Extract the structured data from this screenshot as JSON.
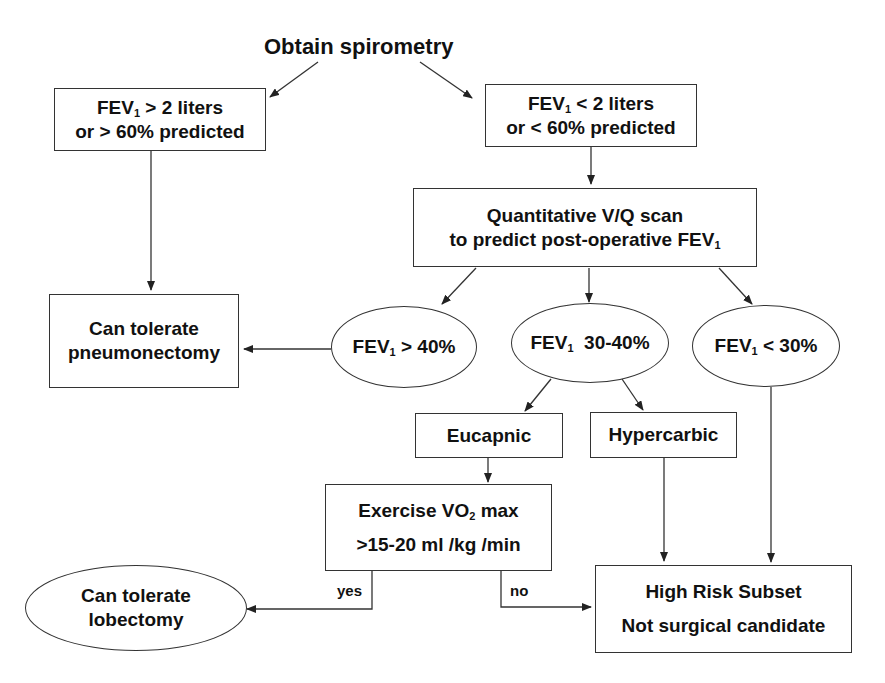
{
  "title": "Obtain spirometry",
  "nodes": {
    "fev_high": {
      "line1_pre": "FEV",
      "line1_sub": "1",
      "line1_post": " > 2 liters",
      "line2": "or > 60% predicted"
    },
    "fev_low": {
      "line1_pre": "FEV",
      "line1_sub": "1",
      "line1_post": " < 2 liters",
      "line2": "or < 60% predicted"
    },
    "vq_scan": {
      "line1": "Quantitative V/Q scan",
      "line2_pre": "to predict post-operative FEV",
      "line2_sub": "1"
    },
    "pneumonectomy": {
      "line1": "Can tolerate",
      "line2": "pneumonectomy"
    },
    "ppo_gt40": {
      "pre": "FEV",
      "sub": "1",
      "post": " > 40%"
    },
    "ppo_30_40": {
      "pre": "FEV",
      "sub": "1",
      "post": "  30-40%"
    },
    "ppo_lt30": {
      "pre": "FEV",
      "sub": "1",
      "post": " < 30%"
    },
    "eucapnic": {
      "label": "Eucapnic"
    },
    "hypercarbic": {
      "label": "Hypercarbic"
    },
    "exercise": {
      "line1_pre": "Exercise VO",
      "line1_sub": "2",
      "line1_post": " max",
      "line2": ">15-20 ml /kg /min"
    },
    "lobectomy": {
      "line1": "Can tolerate",
      "line2": "lobectomy"
    },
    "high_risk": {
      "line1": "High Risk Subset",
      "line2": "Not surgical candidate"
    }
  },
  "edge_labels": {
    "yes": "yes",
    "no": "no"
  },
  "colors": {
    "stroke": "#333333",
    "text": "#111111",
    "background": "#ffffff"
  }
}
